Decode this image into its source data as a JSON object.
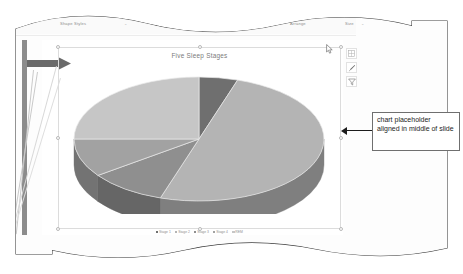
{
  "app": {
    "ribbon_tabs": [
      {
        "label": "Shape Styles",
        "caret": "⌄"
      },
      {
        "label": "WordArt Styles",
        "caret": "⌄"
      },
      {
        "label": "Accessibility",
        "caret": ""
      },
      {
        "label": "Arrange",
        "caret": ""
      },
      {
        "label": "Size",
        "caret": "⌄"
      }
    ]
  },
  "slide": {
    "chart_buttons": [
      {
        "name": "chart-elements-button",
        "glyph": "⊞"
      },
      {
        "name": "chart-styles-button",
        "glyph": "✎"
      },
      {
        "name": "chart-filters-button",
        "glyph": "▽"
      }
    ],
    "status_text": "Notes"
  },
  "annotation": {
    "text": "chart placeholder aligned in middle of slide"
  },
  "chart_data": {
    "type": "pie",
    "title": "Five Sleep Stages",
    "xlabel": "",
    "ylabel": "",
    "legend_position": "bottom",
    "grid": false,
    "three_d": true,
    "categories": [
      "Stage 1",
      "Stage 2",
      "Stage 3",
      "Stage 4",
      "REM"
    ],
    "values": [
      5,
      50,
      10,
      10,
      25
    ],
    "colors": [
      "#6f6f6f",
      "#b4b4b4",
      "#8f8f8f",
      "#a2a2a2",
      "#c6c6c6"
    ],
    "side_colors": [
      "#4e4e4e",
      "#7f7f7f",
      "#666666",
      "#737373",
      "#8c8c8c"
    ],
    "start_angle": 0
  }
}
